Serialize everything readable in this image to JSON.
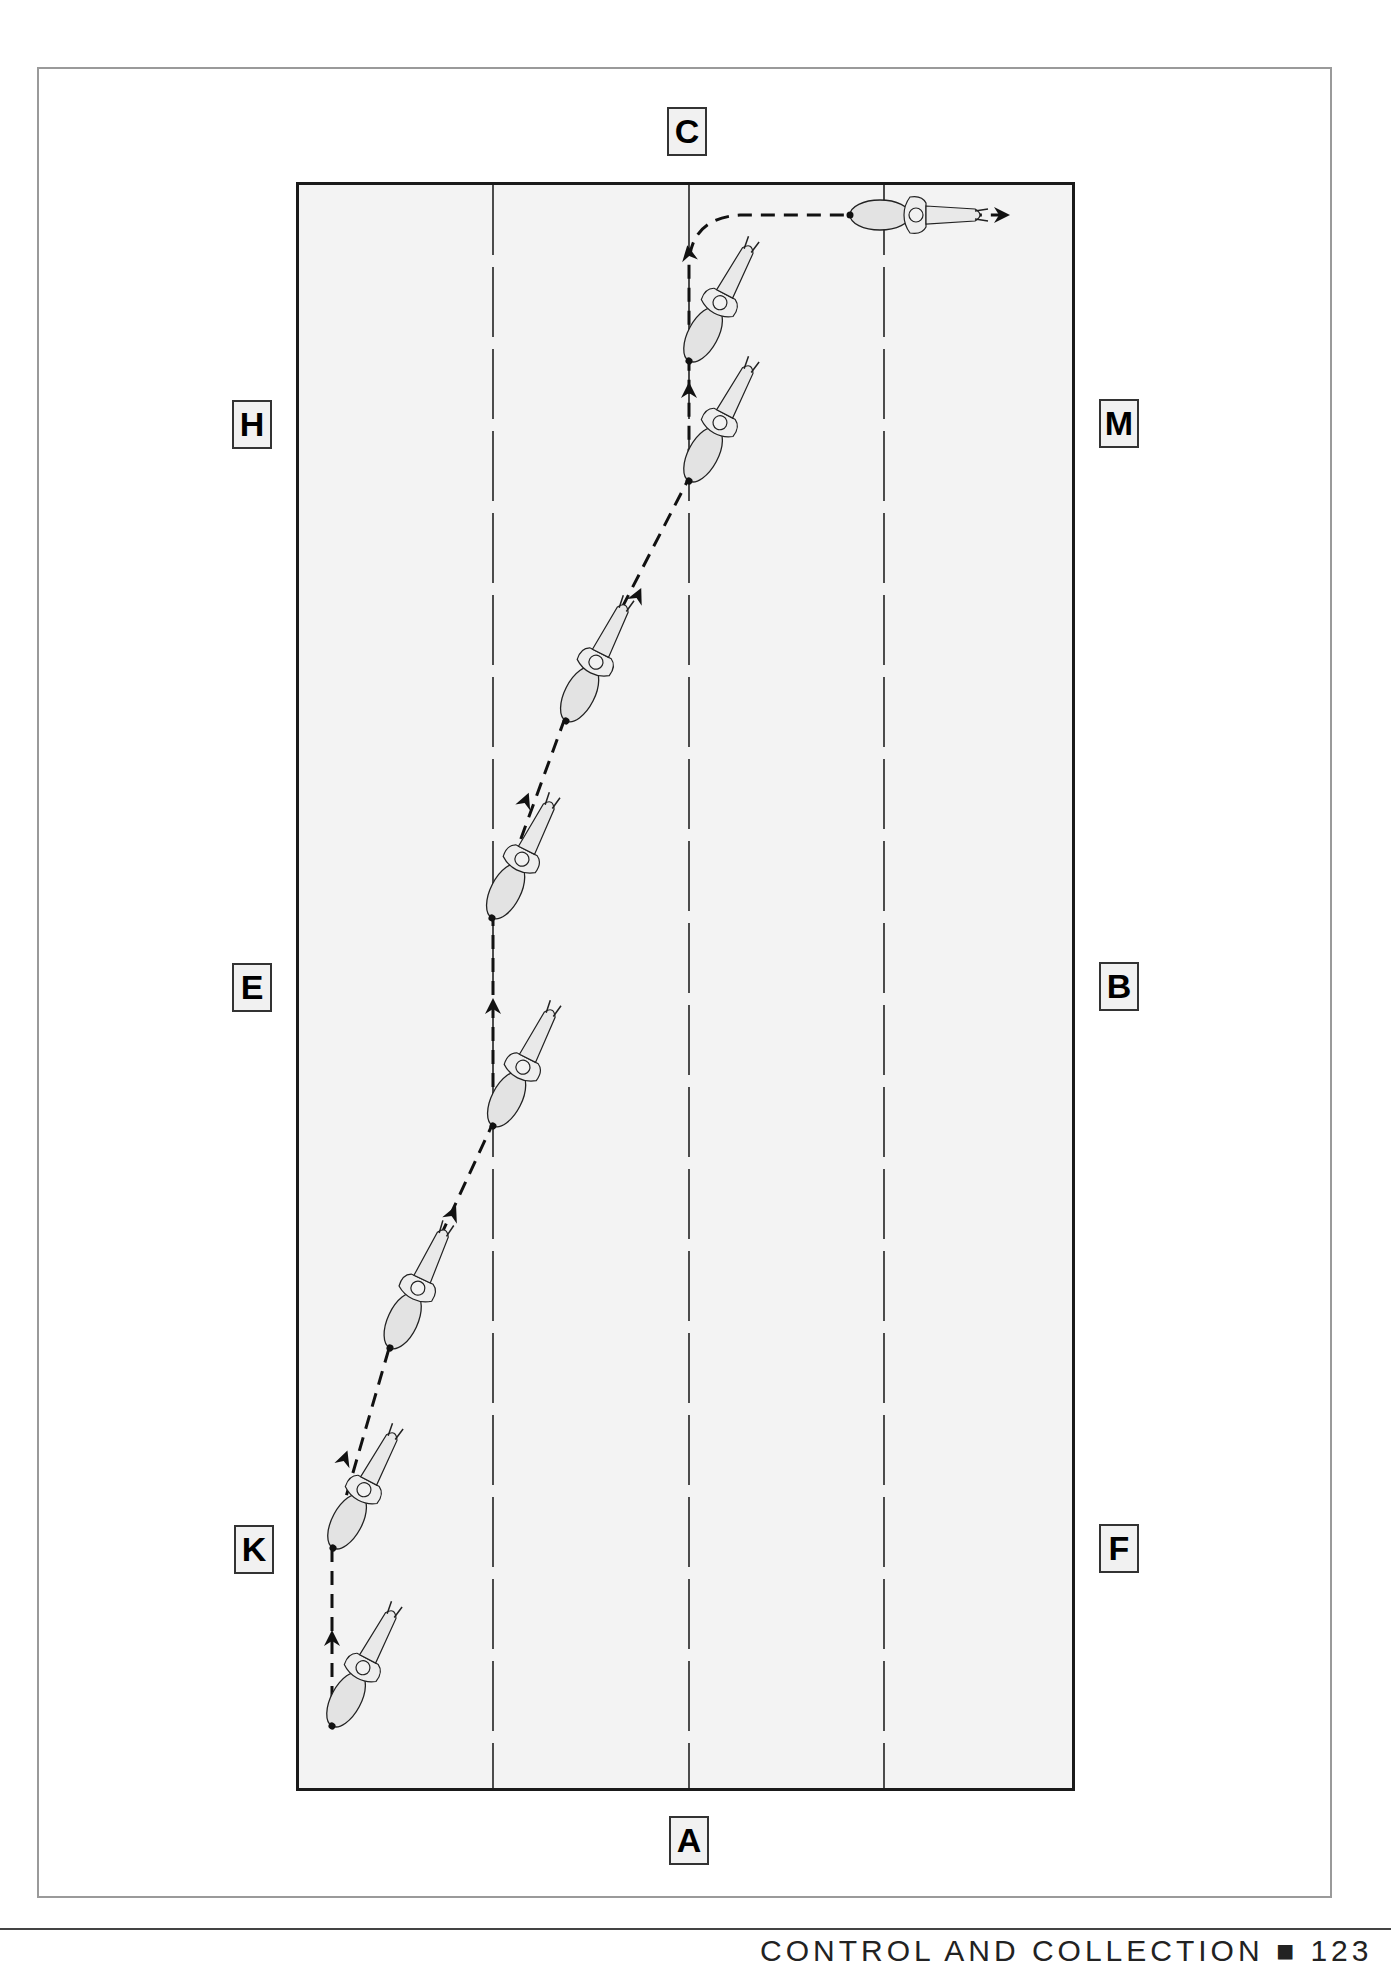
{
  "diagram": {
    "type": "dressage-arena-movement",
    "arena_letters": {
      "top": "C",
      "bottom": "A",
      "left_upper": "H",
      "left_middle": "E",
      "left_lower": "K",
      "right_upper": "M",
      "right_middle": "B",
      "right_lower": "F"
    },
    "quarter_lines": 3,
    "horse_count": 9,
    "path": {
      "start_letter_side": "K",
      "end_letter_side": "C",
      "final_direction": "right"
    },
    "colors": {
      "arena_fill": "#f3f3f3",
      "arena_border": "#1a1a1a",
      "frame_border": "#9a9a9a",
      "path": "#111111",
      "horse_fill": "#e6e6e6"
    }
  },
  "footer": {
    "text": "CONTROL AND COLLECTION ■ 123"
  }
}
